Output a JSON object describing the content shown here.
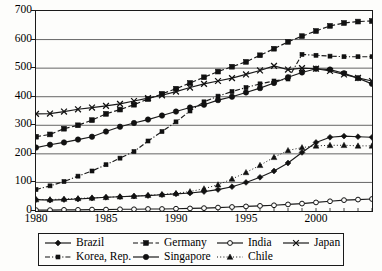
{
  "chart_data": {
    "type": "line",
    "title": "",
    "xlabel": "",
    "ylabel": "",
    "xlim": [
      1980,
      2004
    ],
    "ylim": [
      0,
      700
    ],
    "ytick_step": 100,
    "xtick_labels": [
      "1980",
      "1985",
      "1990",
      "1995",
      "2000"
    ],
    "xtick_values": [
      1980,
      1985,
      1990,
      1995,
      2000
    ],
    "ytick_labels": [
      "0",
      "100",
      "200",
      "300",
      "400",
      "500",
      "600",
      "700"
    ],
    "ytick_values": [
      0,
      100,
      200,
      300,
      400,
      500,
      600,
      700
    ],
    "grid": "horizontal",
    "legend_position": "bottom",
    "x": [
      1980,
      1981,
      1982,
      1983,
      1984,
      1985,
      1986,
      1987,
      1988,
      1989,
      1990,
      1991,
      1992,
      1993,
      1994,
      1995,
      1996,
      1997,
      1998,
      1999,
      2000,
      2001,
      2002,
      2003,
      2004
    ],
    "series": [
      {
        "name": "Brazil",
        "marker": "diamond",
        "line": "solid",
        "color": "#1a1a1a",
        "values": [
          40,
          38,
          40,
          42,
          45,
          48,
          50,
          52,
          54,
          57,
          60,
          63,
          68,
          75,
          85,
          100,
          118,
          140,
          168,
          205,
          240,
          258,
          262,
          260,
          258
        ]
      },
      {
        "name": "Germany",
        "marker": "square",
        "line": "dashed",
        "color": "#1a1a1a",
        "values": [
          260,
          268,
          288,
          300,
          318,
          340,
          355,
          372,
          392,
          410,
          428,
          448,
          468,
          488,
          505,
          522,
          545,
          568,
          592,
          612,
          630,
          648,
          658,
          663,
          665
        ]
      },
      {
        "name": "India",
        "marker": "circle-open",
        "line": "solid",
        "color": "#1a1a1a",
        "values": [
          3,
          3,
          4,
          4,
          5,
          5,
          6,
          6,
          7,
          7,
          8,
          9,
          10,
          12,
          14,
          16,
          18,
          20,
          23,
          26,
          30,
          34,
          38,
          40,
          42
        ]
      },
      {
        "name": "Japan",
        "marker": "x",
        "line": "solid",
        "color": "#1a1a1a",
        "values": [
          340,
          341,
          348,
          356,
          362,
          368,
          375,
          385,
          395,
          405,
          418,
          432,
          445,
          455,
          465,
          478,
          492,
          508,
          495,
          500,
          498,
          490,
          478,
          466,
          455
        ]
      },
      {
        "name": "Korea, Rep.",
        "marker": "square-small",
        "line": "dash-dot",
        "color": "#1a1a1a",
        "values": [
          75,
          88,
          103,
          122,
          140,
          162,
          185,
          208,
          245,
          278,
          312,
          350,
          382,
          402,
          418,
          432,
          445,
          455,
          462,
          548,
          545,
          542,
          540,
          540,
          540
        ]
      },
      {
        "name": "Singapore",
        "marker": "circle-filled",
        "line": "solid",
        "color": "#1a1a1a",
        "values": [
          222,
          232,
          240,
          250,
          260,
          278,
          295,
          308,
          320,
          334,
          348,
          362,
          372,
          388,
          400,
          415,
          430,
          448,
          468,
          485,
          498,
          495,
          482,
          465,
          445
        ]
      },
      {
        "name": "Chile",
        "marker": "triangle",
        "line": "dotted",
        "color": "#1a1a1a",
        "values": [
          40,
          40,
          42,
          44,
          46,
          48,
          50,
          52,
          55,
          58,
          62,
          68,
          78,
          92,
          112,
          135,
          160,
          188,
          212,
          222,
          228,
          230,
          230,
          228,
          228
        ]
      }
    ]
  },
  "legend": {
    "rows": [
      [
        {
          "label": "Brazil",
          "key": "line-diamond-solid"
        },
        {
          "label": "Germany",
          "key": "line-square-dashed"
        },
        {
          "label": "India",
          "key": "line-circle-open-solid"
        },
        {
          "label": "Japan",
          "key": "line-x-solid"
        }
      ],
      [
        {
          "label": "Korea, Rep.",
          "key": "line-square-dashdot"
        },
        {
          "label": "Singapore",
          "key": "line-circle-filled-solid"
        },
        {
          "label": "Chile",
          "key": "line-triangle-dotted"
        }
      ]
    ]
  }
}
